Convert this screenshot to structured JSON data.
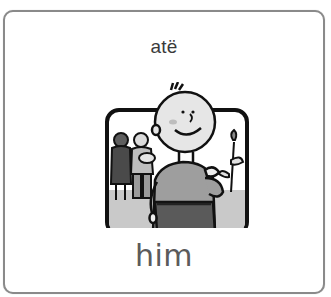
{
  "card": {
    "native_word": "atë",
    "english_word": "him",
    "picture": {
      "icon": "boy-pointing-at-himself-illustration",
      "description": "Grayscale cartoon of a smiling boy in the foreground with a woman and a man holding a baby in the background, inside a rounded black frame"
    },
    "colors": {
      "border": "#8a8a8a",
      "native_text": "#3a3a3a",
      "english_text": "#5b5b5b",
      "background": "#ffffff"
    }
  }
}
